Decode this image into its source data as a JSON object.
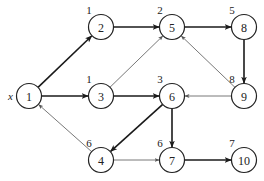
{
  "diagram": {
    "type": "directed-graph",
    "source_label": "x",
    "nodes": [
      {
        "id": "1",
        "x": 29,
        "y": 96,
        "dist": ""
      },
      {
        "id": "2",
        "x": 101,
        "y": 27,
        "dist": "1"
      },
      {
        "id": "3",
        "x": 101,
        "y": 96,
        "dist": "1"
      },
      {
        "id": "4",
        "x": 101,
        "y": 160,
        "dist": "6"
      },
      {
        "id": "5",
        "x": 172,
        "y": 27,
        "dist": "2"
      },
      {
        "id": "6",
        "x": 172,
        "y": 96,
        "dist": "3"
      },
      {
        "id": "7",
        "x": 172,
        "y": 160,
        "dist": "6"
      },
      {
        "id": "8",
        "x": 244,
        "y": 27,
        "dist": "5"
      },
      {
        "id": "9",
        "x": 244,
        "y": 96,
        "dist": "8"
      },
      {
        "id": "10",
        "x": 244,
        "y": 160,
        "dist": "7"
      }
    ],
    "edges": [
      {
        "from": "1",
        "to": "2",
        "style": "thick"
      },
      {
        "from": "1",
        "to": "3",
        "style": "thick"
      },
      {
        "from": "2",
        "to": "5",
        "style": "thick"
      },
      {
        "from": "3",
        "to": "5",
        "style": "thin"
      },
      {
        "from": "3",
        "to": "6",
        "style": "thick"
      },
      {
        "from": "5",
        "to": "8",
        "style": "thick"
      },
      {
        "from": "8",
        "to": "9",
        "style": "thick"
      },
      {
        "from": "9",
        "to": "5",
        "style": "thin"
      },
      {
        "from": "9",
        "to": "6",
        "style": "thin"
      },
      {
        "from": "6",
        "to": "4",
        "style": "thick"
      },
      {
        "from": "6",
        "to": "7",
        "style": "thick"
      },
      {
        "from": "4",
        "to": "1",
        "style": "thin"
      },
      {
        "from": "4",
        "to": "7",
        "style": "thin"
      },
      {
        "from": "7",
        "to": "10",
        "style": "thick"
      }
    ]
  }
}
